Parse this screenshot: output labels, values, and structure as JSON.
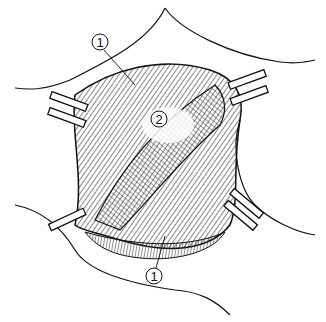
{
  "figure": {
    "type": "anatomical illustration",
    "labels": [
      {
        "id": "label-1-top",
        "text": "1",
        "x": 100,
        "y": 42
      },
      {
        "id": "label-2-center",
        "text": "2",
        "x": 159,
        "y": 119
      },
      {
        "id": "label-1-bottom",
        "text": "1",
        "x": 154,
        "y": 276
      }
    ],
    "colors": {
      "ink": "#111111",
      "paper": "#ffffff",
      "shade": "#555555"
    }
  }
}
